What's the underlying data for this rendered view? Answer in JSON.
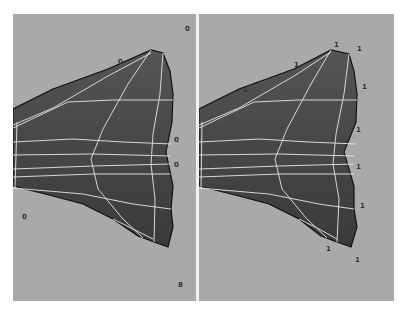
{
  "viewports": {
    "left": {
      "label": "left-viewport",
      "vertex_markers": [
        {
          "text": "0",
          "x": 172,
          "y": 12
        },
        {
          "text": "0",
          "x": 105,
          "y": 45
        },
        {
          "text": "0",
          "x": 161,
          "y": 123
        },
        {
          "text": "0",
          "x": 161,
          "y": 148
        },
        {
          "text": "0",
          "x": 9,
          "y": 200
        },
        {
          "text": "8",
          "x": 165,
          "y": 268
        }
      ]
    },
    "right": {
      "label": "right-viewport",
      "vertex_markers": [
        {
          "text": "1",
          "x": 135,
          "y": 28
        },
        {
          "text": "1",
          "x": 158,
          "y": 32
        },
        {
          "text": "1",
          "x": 95,
          "y": 48
        },
        {
          "text": "1",
          "x": 44,
          "y": 73
        },
        {
          "text": "1",
          "x": 163,
          "y": 70
        },
        {
          "text": "1",
          "x": 157,
          "y": 113
        },
        {
          "text": "1",
          "x": 157,
          "y": 150
        },
        {
          "text": "1",
          "x": 161,
          "y": 189
        },
        {
          "text": "1",
          "x": 127,
          "y": 232
        },
        {
          "text": "1",
          "x": 156,
          "y": 243
        }
      ]
    }
  },
  "colors": {
    "background": "#a9a9a9",
    "mesh_fill": "#4a4a4a",
    "wire": "#e8e8e8",
    "outline": "#111111"
  }
}
